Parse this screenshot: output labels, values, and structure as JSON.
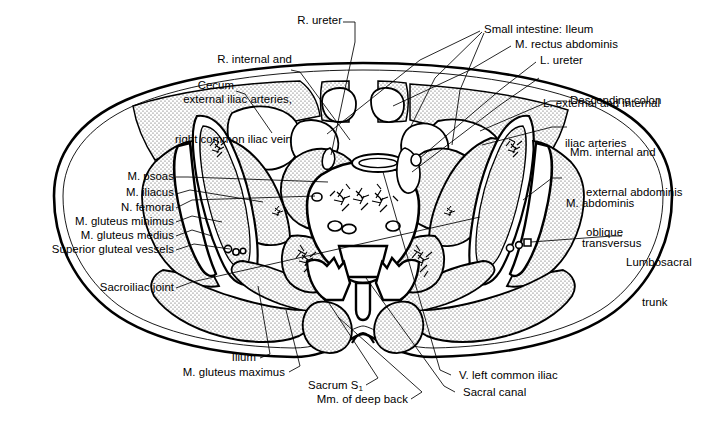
{
  "figure": {
    "type": "anatomical-cross-section",
    "background_color": "#ffffff",
    "line_color": "#000000",
    "stipple_fill_color": "#d8d8d8"
  },
  "labels": {
    "top_left": [
      {
        "id": "iliac-vessels",
        "lines": [
          "R. internal and",
          "external iliac arteries,",
          "right common iliac vein"
        ]
      },
      {
        "id": "cecum",
        "lines": [
          "Cecum"
        ]
      }
    ],
    "top_center": [
      {
        "id": "r-ureter",
        "lines": [
          "R. ureter"
        ]
      }
    ],
    "top_right": [
      {
        "id": "small-intestine-ileum",
        "lines": [
          "Small intestine: Ileum"
        ]
      },
      {
        "id": "m-rectus-abdominis",
        "lines": [
          "M. rectus abdominis"
        ]
      },
      {
        "id": "l-ureter",
        "lines": [
          "L. ureter"
        ]
      },
      {
        "id": "l-iliac-arteries",
        "lines": [
          "L. external and internal",
          "iliac arteries"
        ]
      },
      {
        "id": "descending-colon",
        "lines": [
          "Descending colon"
        ]
      },
      {
        "id": "mm-oblique",
        "lines": [
          "Mm. internal and",
          "external abdominis",
          "oblique"
        ]
      },
      {
        "id": "m-abdominis-transversus",
        "lines": [
          "M. abdominis",
          "transversus"
        ]
      }
    ],
    "right": [
      {
        "id": "lumbosacral-trunk",
        "lines": [
          "Lumbosacral",
          "trunk"
        ]
      }
    ],
    "left": [
      {
        "id": "m-psoas",
        "lines": [
          "M. psoas"
        ]
      },
      {
        "id": "m-iliacus",
        "lines": [
          "M. iliacus"
        ]
      },
      {
        "id": "n-femoral",
        "lines": [
          "N. femoral"
        ]
      },
      {
        "id": "m-gluteus-minimus",
        "lines": [
          "M. gluteus minimus"
        ]
      },
      {
        "id": "m-gluteus-medius",
        "lines": [
          "M. gluteus medius"
        ]
      },
      {
        "id": "superior-gluteal-vessels",
        "lines": [
          "Superior gluteal vessels"
        ]
      },
      {
        "id": "sacroiliac-joint",
        "lines": [
          "Sacroiliac joint"
        ]
      }
    ],
    "bottom_left": [
      {
        "id": "ilium",
        "lines": [
          "Ilium"
        ]
      },
      {
        "id": "m-gluteus-maximus",
        "lines": [
          "M. gluteus maximus"
        ]
      },
      {
        "id": "sacrum-s1",
        "lines": [
          "Sacrum S"
        ],
        "subscript": "1"
      },
      {
        "id": "mm-deep-back",
        "lines": [
          "Mm. of deep back"
        ]
      }
    ],
    "bottom_right": [
      {
        "id": "v-left-common-iliac",
        "lines": [
          "V. left common iliac"
        ]
      },
      {
        "id": "sacral-canal",
        "lines": [
          "Sacral canal"
        ]
      }
    ]
  },
  "label_text": {
    "iliac_vessels_l1": "R. internal and",
    "iliac_vessels_l2": "external iliac arteries,",
    "iliac_vessels_l3": "right common iliac vein",
    "cecum": "Cecum",
    "r_ureter": "R. ureter",
    "small_intestine": "Small intestine: Ileum",
    "rectus_abdominis": "M. rectus abdominis",
    "l_ureter": "L. ureter",
    "l_iliac_l1": "L. external and internal",
    "l_iliac_l2": "iliac arteries",
    "descending_colon": "Descending colon",
    "oblique_l1": "Mm. internal and",
    "oblique_l2": "external abdominis",
    "oblique_l3": "oblique",
    "transversus_l1": "M. abdominis",
    "transversus_l2": "transversus",
    "lumbosacral_l1": "Lumbosacral",
    "lumbosacral_l2": "trunk",
    "m_psoas": "M. psoas",
    "m_iliacus": "M. iliacus",
    "n_femoral": "N. femoral",
    "gluteus_minimus": "M. gluteus minimus",
    "gluteus_medius": "M. gluteus medius",
    "superior_gluteal": "Superior gluteal vessels",
    "sacroiliac_joint": "Sacroiliac joint",
    "ilium": "Ilium",
    "gluteus_maximus": "M. gluteus maximus",
    "sacrum": "Sacrum S",
    "sacrum_sub": "1",
    "mm_deep_back": "Mm. of deep back",
    "v_left_common_iliac": "V. left common iliac",
    "sacral_canal": "Sacral canal"
  }
}
